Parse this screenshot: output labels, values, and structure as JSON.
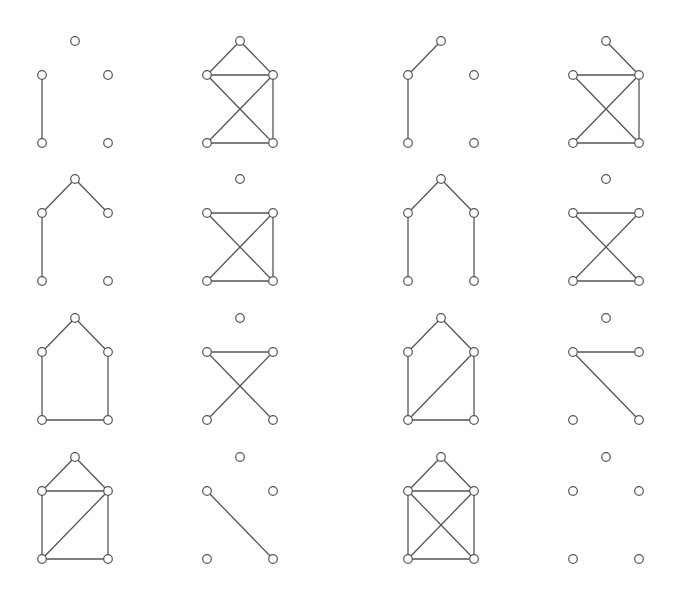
{
  "diagram": {
    "colors": {
      "background": "#ffffff",
      "stroke": "#555555",
      "node_fill": "#ffffff"
    },
    "node_radius": 4.3,
    "layout": {
      "offsets": {
        "T": [
          0,
          -34
        ],
        "L": [
          -33,
          0
        ],
        "R": [
          33,
          0
        ],
        "BL": [
          -33,
          68
        ],
        "BR": [
          33,
          68
        ]
      },
      "column_centers_x": [
        75,
        240,
        441,
        606
      ],
      "row_side_y": [
        75,
        213,
        352,
        491
      ]
    },
    "graphs": [
      {
        "id": 1,
        "row": 0,
        "col": 0,
        "edges": [
          [
            "L",
            "BL"
          ]
        ]
      },
      {
        "id": 2,
        "row": 0,
        "col": 1,
        "edges": [
          [
            "T",
            "L"
          ],
          [
            "T",
            "R"
          ],
          [
            "L",
            "R"
          ],
          [
            "L",
            "BR"
          ],
          [
            "R",
            "BL"
          ],
          [
            "R",
            "BR"
          ],
          [
            "BL",
            "BR"
          ]
        ]
      },
      {
        "id": 3,
        "row": 0,
        "col": 2,
        "edges": [
          [
            "T",
            "L"
          ],
          [
            "L",
            "BL"
          ]
        ]
      },
      {
        "id": 4,
        "row": 0,
        "col": 3,
        "edges": [
          [
            "T",
            "R"
          ],
          [
            "L",
            "R"
          ],
          [
            "L",
            "BR"
          ],
          [
            "R",
            "BL"
          ],
          [
            "R",
            "BR"
          ],
          [
            "BL",
            "BR"
          ]
        ]
      },
      {
        "id": 5,
        "row": 1,
        "col": 0,
        "edges": [
          [
            "T",
            "L"
          ],
          [
            "T",
            "R"
          ],
          [
            "L",
            "BL"
          ]
        ]
      },
      {
        "id": 6,
        "row": 1,
        "col": 1,
        "edges": [
          [
            "L",
            "R"
          ],
          [
            "L",
            "BR"
          ],
          [
            "R",
            "BL"
          ],
          [
            "R",
            "BR"
          ],
          [
            "BL",
            "BR"
          ]
        ]
      },
      {
        "id": 7,
        "row": 1,
        "col": 2,
        "edges": [
          [
            "T",
            "L"
          ],
          [
            "T",
            "R"
          ],
          [
            "L",
            "BL"
          ],
          [
            "R",
            "BR"
          ]
        ]
      },
      {
        "id": 8,
        "row": 1,
        "col": 3,
        "edges": [
          [
            "L",
            "R"
          ],
          [
            "L",
            "BR"
          ],
          [
            "R",
            "BL"
          ],
          [
            "BL",
            "BR"
          ]
        ]
      },
      {
        "id": 9,
        "row": 2,
        "col": 0,
        "edges": [
          [
            "T",
            "L"
          ],
          [
            "T",
            "R"
          ],
          [
            "L",
            "BL"
          ],
          [
            "R",
            "BR"
          ],
          [
            "BL",
            "BR"
          ]
        ]
      },
      {
        "id": 10,
        "row": 2,
        "col": 1,
        "edges": [
          [
            "L",
            "R"
          ],
          [
            "L",
            "BR"
          ],
          [
            "R",
            "BL"
          ]
        ]
      },
      {
        "id": 11,
        "row": 2,
        "col": 2,
        "edges": [
          [
            "T",
            "L"
          ],
          [
            "T",
            "R"
          ],
          [
            "L",
            "BL"
          ],
          [
            "R",
            "BR"
          ],
          [
            "R",
            "BL"
          ],
          [
            "BL",
            "BR"
          ]
        ]
      },
      {
        "id": 12,
        "row": 2,
        "col": 3,
        "edges": [
          [
            "L",
            "R"
          ],
          [
            "L",
            "BR"
          ]
        ]
      },
      {
        "id": 13,
        "row": 3,
        "col": 0,
        "edges": [
          [
            "T",
            "L"
          ],
          [
            "T",
            "R"
          ],
          [
            "L",
            "R"
          ],
          [
            "L",
            "BL"
          ],
          [
            "R",
            "BR"
          ],
          [
            "R",
            "BL"
          ],
          [
            "BL",
            "BR"
          ]
        ]
      },
      {
        "id": 14,
        "row": 3,
        "col": 1,
        "edges": [
          [
            "L",
            "BR"
          ]
        ]
      },
      {
        "id": 15,
        "row": 3,
        "col": 2,
        "edges": [
          [
            "T",
            "L"
          ],
          [
            "T",
            "R"
          ],
          [
            "L",
            "R"
          ],
          [
            "L",
            "BL"
          ],
          [
            "R",
            "BR"
          ],
          [
            "L",
            "BR"
          ],
          [
            "R",
            "BL"
          ],
          [
            "BL",
            "BR"
          ]
        ]
      },
      {
        "id": 16,
        "row": 3,
        "col": 3,
        "edges": []
      }
    ]
  }
}
